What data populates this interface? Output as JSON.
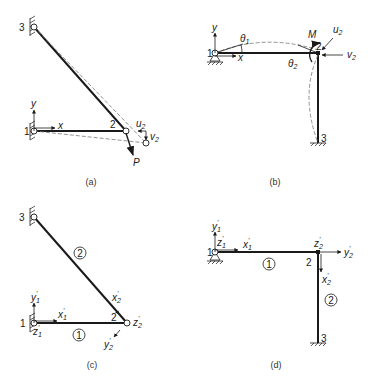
{
  "figure": {
    "panels": [
      {
        "id": "a",
        "caption": "(a)",
        "nodes": [
          "1",
          "2",
          "3"
        ],
        "axes": {
          "x": "x",
          "y": "y"
        },
        "displacements": {
          "u": "u",
          "u_sub": "2",
          "v": "v",
          "v_sub": "2"
        },
        "load": "P"
      },
      {
        "id": "b",
        "caption": "(b)",
        "nodes": [
          "1",
          "2",
          "3"
        ],
        "axes": {
          "x": "x",
          "y": "y"
        },
        "rotations": {
          "theta1": "θ",
          "theta1_sub": "1",
          "theta2": "θ",
          "theta2_sub": "2"
        },
        "moment": "M",
        "displacements": {
          "u": "u",
          "u_sub": "2",
          "v": "v",
          "v_sub": "2"
        }
      },
      {
        "id": "c",
        "caption": "(c)",
        "nodes": [
          "1",
          "2",
          "3"
        ],
        "members": [
          "1",
          "2"
        ],
        "local_axes": {
          "x1": "x",
          "x1_sub": "1",
          "y1": "y",
          "y1_sub": "1",
          "z1": "z",
          "z1_sub": "1",
          "x2": "x",
          "x2_sub": "2",
          "y2": "y",
          "y2_sub": "2",
          "z2": "z",
          "z2_sub": "2"
        },
        "prime": "'"
      },
      {
        "id": "d",
        "caption": "(d)",
        "nodes": [
          "1",
          "2",
          "3"
        ],
        "members": [
          "1",
          "2"
        ],
        "local_axes": {
          "x1": "x",
          "x1_sub": "1",
          "y1": "y",
          "y1_sub": "1",
          "z1": "z",
          "z1_sub": "1",
          "x2": "x",
          "x2_sub": "2",
          "y2": "y",
          "y2_sub": "2",
          "z2": "z",
          "z2_sub": "2"
        },
        "prime": "'"
      }
    ]
  }
}
